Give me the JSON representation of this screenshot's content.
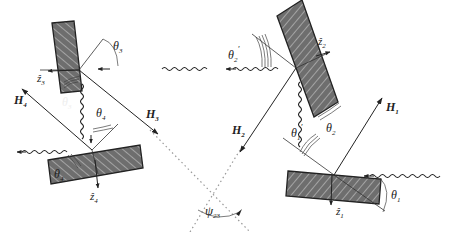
{
  "diagram": {
    "type": "four-crystal x-ray diffraction geometry",
    "colors": {
      "crystal_fill": "#6e6e6e",
      "hatch": "#c8c8c8",
      "line": "#222222",
      "dotted": "#999999",
      "background": "#ffffff"
    },
    "labels": {
      "theta3": "θ",
      "theta3_sub": "3",
      "theta3_prime": "θ",
      "theta3_prime_sub": "3",
      "theta3_prime_mark": "′",
      "theta4": "θ",
      "theta4_sub": "4",
      "theta4_prime": "θ",
      "theta4_prime_sub": "4",
      "z3": "ẑ",
      "z3_sub": "3",
      "z4": "ẑ",
      "z4_sub": "4",
      "H4": "H",
      "H4_sub": "4",
      "H3": "H",
      "H3_sub": "3",
      "H2": "H",
      "H2_sub": "2",
      "H1": "H",
      "H1_sub": "1",
      "theta2_prime": "θ",
      "theta2_prime_sub": "2",
      "theta2_prime_mark": "′",
      "z2": "ẑ",
      "z2_sub": "2",
      "theta2": "θ",
      "theta2_sub": "2",
      "theta1_prime": "θ",
      "theta1_prime_sub": "1",
      "theta1_prime_mark": "′",
      "theta1": "θ",
      "theta1_sub": "1",
      "z1": "ẑ",
      "z1_sub": "1",
      "psi23": "ψ",
      "psi23_sub": "23"
    }
  }
}
